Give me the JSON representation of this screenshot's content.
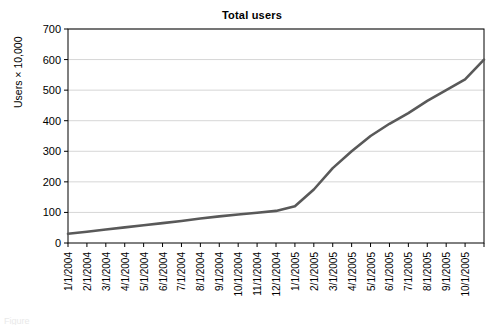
{
  "chart_data": {
    "type": "line",
    "title": "Total users",
    "xlabel": "",
    "ylabel": "Users × 10,000",
    "ylim": [
      0,
      700
    ],
    "y_ticks": [
      0,
      100,
      200,
      300,
      400,
      500,
      600,
      700
    ],
    "grid": "horizontal",
    "legend": "none",
    "line_color": "#595959",
    "categories": [
      "1/1/2004",
      "2/1/2004",
      "3/1/2004",
      "4/1/2004",
      "5/1/2004",
      "6/1/2004",
      "7/1/2004",
      "8/1/2004",
      "9/1/2004",
      "10/1/2004",
      "11/1/2004",
      "12/1/2004",
      "1/1/2005",
      "2/1/2005",
      "3/1/2005",
      "4/1/2005",
      "5/1/2005",
      "6/1/2005",
      "7/1/2005",
      "8/1/2005",
      "9/1/2005",
      "10/1/2005"
    ],
    "series": [
      {
        "name": "Total users",
        "values": [
          30,
          37,
          44,
          51,
          58,
          65,
          72,
          80,
          87,
          93,
          99,
          105,
          120,
          175,
          245,
          300,
          350,
          390,
          425,
          465,
          500,
          535
        ]
      }
    ],
    "end_value": 600,
    "x_tick_count": 23
  },
  "chart": {
    "title": "Total users",
    "y_axis_title": "Users × 10,000",
    "y_tick_labels": [
      "700",
      "600",
      "500",
      "400",
      "300",
      "200",
      "100",
      "0"
    ],
    "x_tick_labels": [
      "1/1/2004",
      "2/1/2004",
      "3/1/2004",
      "4/1/2004",
      "5/1/2004",
      "6/1/2004",
      "7/1/2004",
      "8/1/2004",
      "9/1/2004",
      "10/1/2004",
      "11/1/2004",
      "12/1/2004",
      "1/1/2005",
      "2/1/2005",
      "3/1/2005",
      "4/1/2005",
      "5/1/2005",
      "6/1/2005",
      "7/1/2005",
      "8/1/2005",
      "9/1/2005",
      "10/1/2005"
    ]
  },
  "caption": {
    "clipped_text": "Figure"
  },
  "colors": {
    "series_line": "#595959",
    "gridline": "#d6d6d6",
    "axis": "#000000",
    "background": "#ffffff"
  }
}
